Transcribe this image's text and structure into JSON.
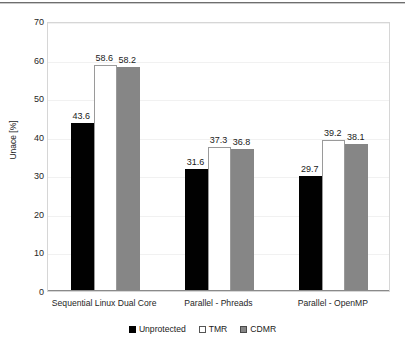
{
  "chart_data": {
    "type": "bar",
    "title": "",
    "xlabel": "",
    "ylabel": "Unace [%]",
    "ylim": [
      0,
      70
    ],
    "yticks": [
      0,
      10,
      20,
      30,
      40,
      50,
      60,
      70
    ],
    "grid": true,
    "legend_position": "bottom",
    "categories": [
      "Sequential Linux Dual Core",
      "Parallel - Phreads",
      "Parallel - OpenMP"
    ],
    "series": [
      {
        "name": "Unprotected",
        "color": "#010101",
        "values": [
          43.6,
          31.6,
          29.7
        ]
      },
      {
        "name": "TMR",
        "color": "#ffffff",
        "values": [
          58.6,
          37.3,
          39.2
        ]
      },
      {
        "name": "CDMR",
        "color": "#868686",
        "values": [
          58.2,
          36.8,
          38.1
        ]
      }
    ],
    "data_labels": [
      [
        "43.6",
        "58.6",
        "58.2"
      ],
      [
        "31.6",
        "37.3",
        "36.8"
      ],
      [
        "29.7",
        "39.2",
        "38.1"
      ]
    ],
    "ytick_labels": [
      "0",
      "10",
      "20",
      "30",
      "40",
      "50",
      "60",
      "70"
    ],
    "category_labels": [
      "Sequential Linux Dual Core",
      "Parallel - Phreads",
      "Parallel - OpenMP"
    ],
    "legend_labels": [
      "Unprotected",
      "TMR",
      "CDMR"
    ]
  }
}
